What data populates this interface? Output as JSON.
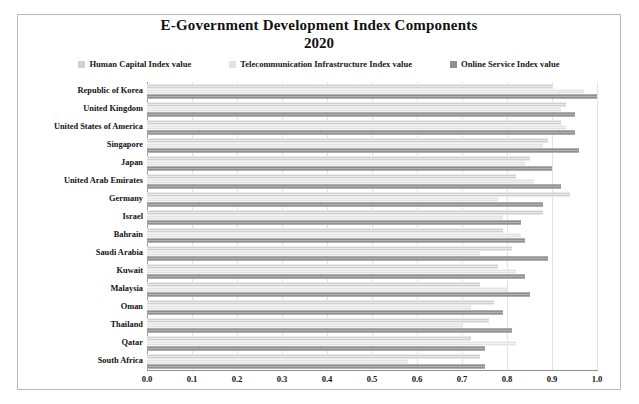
{
  "chart_data": {
    "type": "bar",
    "orientation": "horizontal",
    "title": "E-Government Development Index Components",
    "subtitle": "2020",
    "xlabel": "",
    "ylabel": "",
    "xlim": [
      0.0,
      1.0
    ],
    "xticks": [
      "0.0",
      "0.1",
      "0.2",
      "0.3",
      "0.4",
      "0.5",
      "0.6",
      "0.7",
      "0.8",
      "0.9",
      "1.0"
    ],
    "grid": true,
    "legend_position": "top",
    "categories": [
      "Republic of Korea",
      "United Kingdom",
      "United States of America",
      "Singapore",
      "Japan",
      "United Arab Emirates",
      "Germany",
      "Israel",
      "Bahrain",
      "Saudi Arabia",
      "Kuwait",
      "Malaysia",
      "Oman",
      "Thailand",
      "Qatar",
      "South Africa"
    ],
    "series": [
      {
        "name": "Human Capital Index value",
        "color": "#d0d0d0",
        "values": [
          0.9,
          0.93,
          0.92,
          0.89,
          0.85,
          0.82,
          0.94,
          0.88,
          0.79,
          0.81,
          0.78,
          0.74,
          0.77,
          0.76,
          0.72,
          0.74
        ]
      },
      {
        "name": "Telecommunication Infrastructure Index value",
        "color": "#e2e2e2",
        "values": [
          0.97,
          0.92,
          0.93,
          0.88,
          0.84,
          0.86,
          0.78,
          0.79,
          0.83,
          0.74,
          0.82,
          0.8,
          0.72,
          0.7,
          0.82,
          0.58
        ]
      },
      {
        "name": "Online Service Index value",
        "color": "#8f8f8f",
        "values": [
          1.0,
          0.95,
          0.95,
          0.96,
          0.9,
          0.92,
          0.88,
          0.83,
          0.84,
          0.89,
          0.84,
          0.85,
          0.79,
          0.81,
          0.75,
          0.75
        ]
      }
    ]
  }
}
